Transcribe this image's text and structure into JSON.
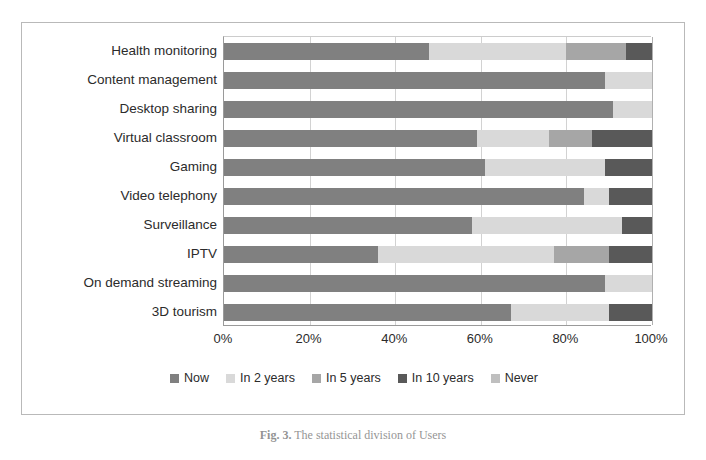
{
  "caption": {
    "figure_number": "Fig. 3.",
    "text": "The statistical division of Users"
  },
  "chart_data": {
    "type": "bar",
    "orientation": "horizontal",
    "stacked": true,
    "normalized": true,
    "title": "",
    "xlabel": "",
    "ylabel": "",
    "xlim": [
      0,
      100
    ],
    "grid": true,
    "legend_position": "bottom",
    "tick_labels": [
      "0%",
      "20%",
      "40%",
      "60%",
      "80%",
      "100%"
    ],
    "tick_values": [
      0,
      20,
      40,
      60,
      80,
      100
    ],
    "categories": [
      "Health monitoring",
      "Content management",
      "Desktop sharing",
      "Virtual classroom",
      "Gaming",
      "Video telephony",
      "Surveillance",
      "IPTV",
      "On demand streaming",
      "3D tourism"
    ],
    "series": [
      {
        "name": "Now",
        "color": "#808080",
        "values": [
          48,
          89,
          91,
          59,
          61,
          84,
          58,
          36,
          89,
          67
        ]
      },
      {
        "name": "In 2 years",
        "color": "#d9d9d9",
        "values": [
          32,
          11,
          9,
          17,
          28,
          6,
          35,
          41,
          11,
          23
        ]
      },
      {
        "name": "In 5 years",
        "color": "#a6a6a6",
        "values": [
          14,
          0,
          0,
          10,
          0,
          0,
          0,
          13,
          0,
          0
        ]
      },
      {
        "name": "In 10 years",
        "color": "#595959",
        "values": [
          6,
          0,
          0,
          14,
          11,
          10,
          7,
          10,
          0,
          10
        ]
      },
      {
        "name": "Never",
        "color": "#bfbfbf",
        "values": [
          0,
          0,
          0,
          0,
          0,
          0,
          0,
          0,
          0,
          0
        ]
      }
    ]
  }
}
